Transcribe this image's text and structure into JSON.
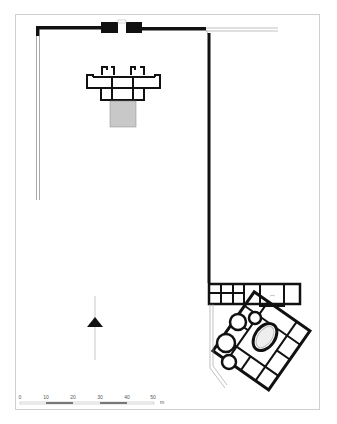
{
  "figure": {
    "type": "architectural site plan",
    "frame_color": "#cfcfcf",
    "wall_color": "#111111",
    "hatch_color": "#c8c8c8"
  },
  "scale_bar": {
    "ticks": [
      "0",
      "10",
      "20",
      "30",
      "40",
      "50"
    ],
    "unit": "m"
  },
  "north_arrow": {
    "symbol": "triangle-up"
  }
}
